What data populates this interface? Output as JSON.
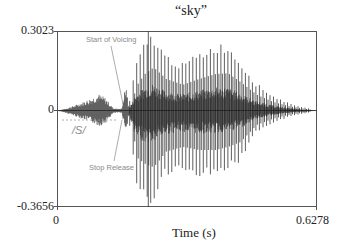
{
  "chart_data": {
    "type": "line",
    "title": "“sky”",
    "xlabel": "Time (s)",
    "ylabel": "",
    "xlim": [
      0,
      0.6278
    ],
    "ylim": [
      -0.3656,
      0.3023
    ],
    "x_tick_labels": [
      "0",
      "0.6278"
    ],
    "y_tick_labels": [
      "0.3023",
      "0",
      "-0.3656"
    ],
    "grid": false,
    "legend": null,
    "series": [
      {
        "name": "waveform",
        "description": "Speech waveform of the word 'sky': low-amplitude fricative /s/ noise, brief stop closure, stop release burst, then voiced vowel with periodic pitch pulses decaying toward the end",
        "envelope": [
          {
            "t": 0.0,
            "pos": 0.0,
            "neg": 0.0
          },
          {
            "t": 0.02,
            "pos": 0.01,
            "neg": -0.01
          },
          {
            "t": 0.05,
            "pos": 0.03,
            "neg": -0.03
          },
          {
            "t": 0.08,
            "pos": 0.055,
            "neg": -0.05
          },
          {
            "t": 0.1,
            "pos": 0.075,
            "neg": -0.07
          },
          {
            "t": 0.115,
            "pos": 0.06,
            "neg": -0.06
          },
          {
            "t": 0.135,
            "pos": 0.012,
            "neg": -0.012
          },
          {
            "t": 0.155,
            "pos": 0.008,
            "neg": -0.008
          },
          {
            "t": 0.165,
            "pos": 0.11,
            "neg": -0.09
          },
          {
            "t": 0.175,
            "pos": 0.04,
            "neg": -0.06
          },
          {
            "t": 0.19,
            "pos": 0.18,
            "neg": -0.3
          },
          {
            "t": 0.21,
            "pos": 0.26,
            "neg": -0.34
          },
          {
            "t": 0.23,
            "pos": 0.3,
            "neg": -0.36
          },
          {
            "t": 0.26,
            "pos": 0.22,
            "neg": -0.26
          },
          {
            "t": 0.3,
            "pos": 0.18,
            "neg": -0.23
          },
          {
            "t": 0.34,
            "pos": 0.22,
            "neg": -0.25
          },
          {
            "t": 0.38,
            "pos": 0.255,
            "neg": -0.25
          },
          {
            "t": 0.41,
            "pos": 0.26,
            "neg": -0.23
          },
          {
            "t": 0.44,
            "pos": 0.2,
            "neg": -0.2
          },
          {
            "t": 0.48,
            "pos": 0.11,
            "neg": -0.09
          },
          {
            "t": 0.52,
            "pos": 0.06,
            "neg": -0.05
          },
          {
            "t": 0.56,
            "pos": 0.03,
            "neg": -0.025
          },
          {
            "t": 0.6,
            "pos": 0.012,
            "neg": -0.01
          },
          {
            "t": 0.6278,
            "pos": 0.002,
            "neg": -0.002
          }
        ]
      }
    ],
    "annotations": [
      {
        "text": "Start of Voicing",
        "t": 0.165
      },
      {
        "text": "Stop Release",
        "t": 0.16
      },
      {
        "text": "/S/",
        "t_start": 0.005,
        "t_end": 0.15
      }
    ],
    "cursor_t": 0.22
  },
  "labels": {
    "title": "“sky”",
    "y_top": "0.3023",
    "y_zero": "0",
    "y_bottom": "-0.3656",
    "x_left": "0",
    "x_right": "0.6278",
    "xlabel": "Time (s)",
    "annot_voicing": "Start of Voicing",
    "annot_release": "Stop Release",
    "annot_s": "/S/"
  },
  "colors": {
    "waveform": "#1a1a1a",
    "frame": "#555555",
    "annotation": "#8a8a8a"
  }
}
